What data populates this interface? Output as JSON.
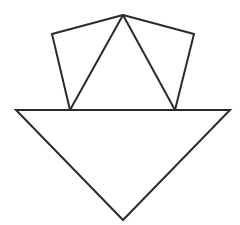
{
  "diagram": {
    "stroke_color": "#2b2b2b",
    "background_color": "#ffffff",
    "stroke_width": 2,
    "points": {
      "apex": [
        123,
        15
      ],
      "left_quad_outer": [
        52,
        34
      ],
      "right_quad_outer": [
        194,
        34
      ],
      "left_quad_base": [
        70,
        110
      ],
      "right_quad_base": [
        175,
        110
      ],
      "triangle_left": [
        16,
        110
      ],
      "triangle_right": [
        230,
        110
      ],
      "triangle_bottom": [
        123,
        220
      ]
    },
    "shapes": [
      {
        "name": "left-quadrilateral",
        "points": "123,15 52,34 70,110 123,15"
      },
      {
        "name": "right-quadrilateral",
        "points": "123,15 194,34 175,110 123,15"
      },
      {
        "name": "center-triangle",
        "points": "123,15 70,110 175,110"
      },
      {
        "name": "inverted-triangle",
        "points": "16,110 230,110 123,220"
      }
    ]
  }
}
